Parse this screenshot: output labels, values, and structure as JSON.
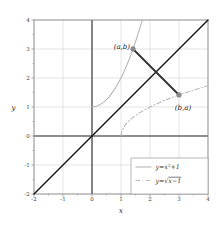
{
  "figure": {
    "background": "#ffffff",
    "plot_area": {
      "left": 34,
      "top": 20,
      "right": 208,
      "bottom": 194
    }
  },
  "chart_data": {
    "type": "line",
    "title": "",
    "xlabel": "x",
    "ylabel": "y",
    "xlim": [
      -2,
      4
    ],
    "ylim": [
      -2,
      4
    ],
    "xticks": [
      -2,
      -1,
      0,
      1,
      2,
      3,
      4
    ],
    "yticks": [
      -2,
      -1,
      0,
      1,
      2,
      3,
      4
    ],
    "minor_ticks_x": [
      -1.5,
      -0.5,
      0.5,
      1.5,
      2.5,
      3.5
    ],
    "minor_ticks_y": [
      -1.5,
      -0.5,
      0.5,
      1.5,
      2.5,
      3.5
    ],
    "grid": "major",
    "series": [
      {
        "name": "identity-line",
        "math": "y = x",
        "style": "solid",
        "color_key": "identity",
        "width": 1.5,
        "in_legend": false,
        "points": [
          [
            -2,
            -2
          ],
          [
            4,
            4
          ]
        ]
      },
      {
        "name": "parabola",
        "math": "y = x²+1",
        "style": "solid",
        "color_key": "curve",
        "width": 1.1,
        "in_legend": true,
        "points": [
          [
            0,
            1
          ],
          [
            0.2,
            1.04
          ],
          [
            0.4,
            1.16
          ],
          [
            0.6,
            1.36
          ],
          [
            0.8,
            1.64
          ],
          [
            1,
            2
          ],
          [
            1.1,
            2.21
          ],
          [
            1.2,
            2.44
          ],
          [
            1.3,
            2.69
          ],
          [
            1.4,
            2.96
          ],
          [
            1.5,
            3.25
          ],
          [
            1.6,
            3.56
          ],
          [
            1.7,
            3.89
          ],
          [
            1.732,
            4
          ]
        ]
      },
      {
        "name": "sqrt-curve",
        "math": "y = √(x−1)",
        "style": "dashdot",
        "color_key": "curve",
        "width": 1.1,
        "in_legend": true,
        "points": [
          [
            1,
            0
          ],
          [
            1.04,
            0.2
          ],
          [
            1.16,
            0.4
          ],
          [
            1.36,
            0.6
          ],
          [
            1.64,
            0.8
          ],
          [
            2,
            1
          ],
          [
            2.21,
            1.1
          ],
          [
            2.44,
            1.2
          ],
          [
            2.69,
            1.3
          ],
          [
            2.96,
            1.4
          ],
          [
            3.25,
            1.5
          ],
          [
            3.56,
            1.6
          ],
          [
            3.89,
            1.7
          ],
          [
            4,
            1.732
          ]
        ]
      },
      {
        "name": "reflection-segment",
        "math": "segment (a,b)–(b,a)",
        "style": "solid",
        "color_key": "segment",
        "width": 1.8,
        "in_legend": false,
        "points": [
          [
            1.414,
            3
          ],
          [
            3,
            1.414
          ]
        ]
      }
    ],
    "marked_points": [
      {
        "x": 1.414,
        "y": 3,
        "label": "(a,b)",
        "anchor": "end",
        "dx": -3,
        "dy": -0.5,
        "r": 2.4
      },
      {
        "x": 3,
        "y": 1.414,
        "label": "(b,a)",
        "anchor": "middle",
        "dx": 4,
        "dy": 15.5,
        "r": 2.4
      }
    ],
    "legend": {
      "position": "south-east",
      "box": {
        "x": 131,
        "y": 158,
        "w": 77,
        "h": 36
      },
      "entries": [
        {
          "series": "parabola",
          "style": "solid",
          "label": "y=x²+1",
          "parts": [
            {
              "t": "y=x²+1"
            }
          ]
        },
        {
          "series": "sqrt-curve",
          "style": "dashdot",
          "label": "y=√x−1",
          "parts": [
            {
              "t": "y=√"
            },
            {
              "t": "x−1",
              "overline": true
            }
          ]
        }
      ]
    },
    "colors": {
      "grid": "#d9d9d9",
      "frame": "#8f8f8f",
      "axis": "#2b2b2b",
      "identity": "#1c1c1c",
      "curve": "#b9b9b9",
      "segment": "#303030",
      "point": "#8c8c8c",
      "point_stroke": "#6e6e6e",
      "tick_text": "#3c3c3c",
      "label_text": "#222222",
      "legend_border": "#9a9a9a",
      "legend_bg": "#ffffff"
    }
  }
}
